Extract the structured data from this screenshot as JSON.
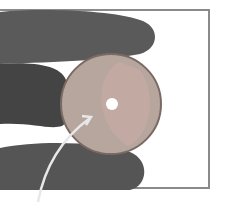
{
  "image": {
    "description": "Photo of fingers holding a translucent disc with a central hole; a curved arrow points to the disc",
    "colors": {
      "skin": "#5f5f5f",
      "skin_dark": "#3f3f3f",
      "disc": "#b8a8a0",
      "disc_inner": "#c2aca4",
      "hole": "#ffffff",
      "frame": "#8a8a8a",
      "arrow": "#e8e8e8"
    }
  }
}
